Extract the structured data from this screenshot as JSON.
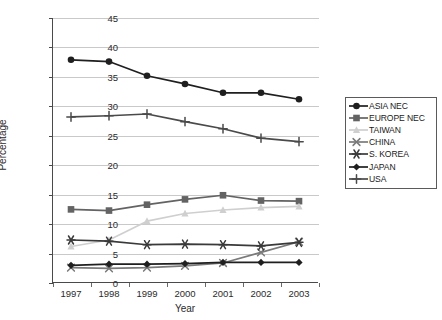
{
  "chart_data": {
    "type": "line",
    "title": "",
    "xlabel": "Year",
    "ylabel": "Percentage",
    "categories": [
      "1997",
      "1998",
      "1999",
      "2000",
      "2001",
      "2002",
      "2003"
    ],
    "x": [
      1997,
      1998,
      1999,
      2000,
      2001,
      2002,
      2003
    ],
    "ylim": [
      0,
      45
    ],
    "yticks": [
      0,
      5,
      10,
      15,
      20,
      25,
      30,
      35,
      40,
      45
    ],
    "grid": true,
    "legend_position": "right",
    "series": [
      {
        "name": "ASIA NEC",
        "marker": "circle",
        "color": "#1f1f1f",
        "values": [
          37.9,
          37.6,
          35.2,
          33.8,
          32.3,
          32.3,
          31.2
        ]
      },
      {
        "name": "EUROPE NEC",
        "marker": "square",
        "color": "#636363",
        "values": [
          12.5,
          12.3,
          13.3,
          14.2,
          14.9,
          14.0,
          13.9
        ]
      },
      {
        "name": "TAIWAN",
        "marker": "triangle",
        "color": "#cfcfcf",
        "values": [
          6.2,
          7.3,
          10.5,
          11.8,
          12.4,
          12.8,
          13.0
        ]
      },
      {
        "name": "CHINA",
        "marker": "cross",
        "color": "#7a7a7a",
        "values": [
          2.6,
          2.5,
          2.6,
          2.9,
          3.4,
          5.2,
          7.0
        ]
      },
      {
        "name": "S. KOREA",
        "marker": "asterisk",
        "color": "#3a3a3a",
        "values": [
          7.3,
          7.1,
          6.5,
          6.6,
          6.5,
          6.3,
          6.9
        ]
      },
      {
        "name": "JAPAN",
        "marker": "diamond",
        "color": "#1f1f1f",
        "values": [
          3.0,
          3.2,
          3.2,
          3.3,
          3.5,
          3.5,
          3.5
        ]
      },
      {
        "name": "USA",
        "marker": "plus",
        "color": "#4a4a4a",
        "values": [
          28.2,
          28.4,
          28.7,
          27.4,
          26.2,
          24.6,
          24.0
        ]
      }
    ]
  }
}
